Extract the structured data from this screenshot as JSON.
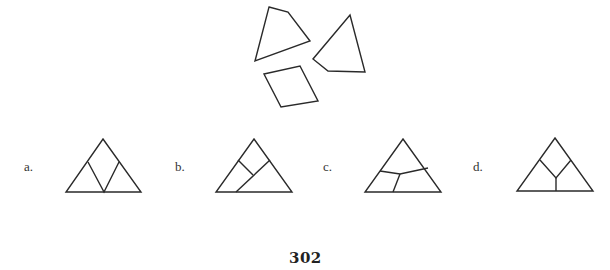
{
  "puzzle": {
    "pieces": [
      {
        "id": "piece-1",
        "shape": "quadrilateral",
        "points": "269,7 288,12 310,41 255,61"
      },
      {
        "id": "piece-2",
        "shape": "quadrilateral",
        "points": "350,15 365,72 328,71 313,59"
      },
      {
        "id": "piece-3",
        "shape": "quadrilateral",
        "points": "264,74 300,66 318,101 281,107"
      }
    ],
    "options": [
      {
        "label": "a.",
        "triangle": "103,139 141,192 66,192",
        "inner": [
          "88,162 104,192 119,162"
        ]
      },
      {
        "label": "b.",
        "triangle": "254,139 292,192 216,192",
        "inner": [
          "238,160 253,175",
          "270,160 236,192"
        ]
      },
      {
        "label": "c.",
        "triangle": "403,139 441,192 365,192",
        "inner": [
          "380,171 400,174 428,168",
          "400,174 393,192"
        ]
      },
      {
        "label": "d.",
        "triangle": "555,138 593,191 517,191",
        "inner": [
          "540,160 556,178 571,160",
          "556,178 556,191"
        ]
      }
    ]
  },
  "page_number": "302",
  "colors": {
    "stroke": "#2a2a2a",
    "background": "#ffffff"
  }
}
